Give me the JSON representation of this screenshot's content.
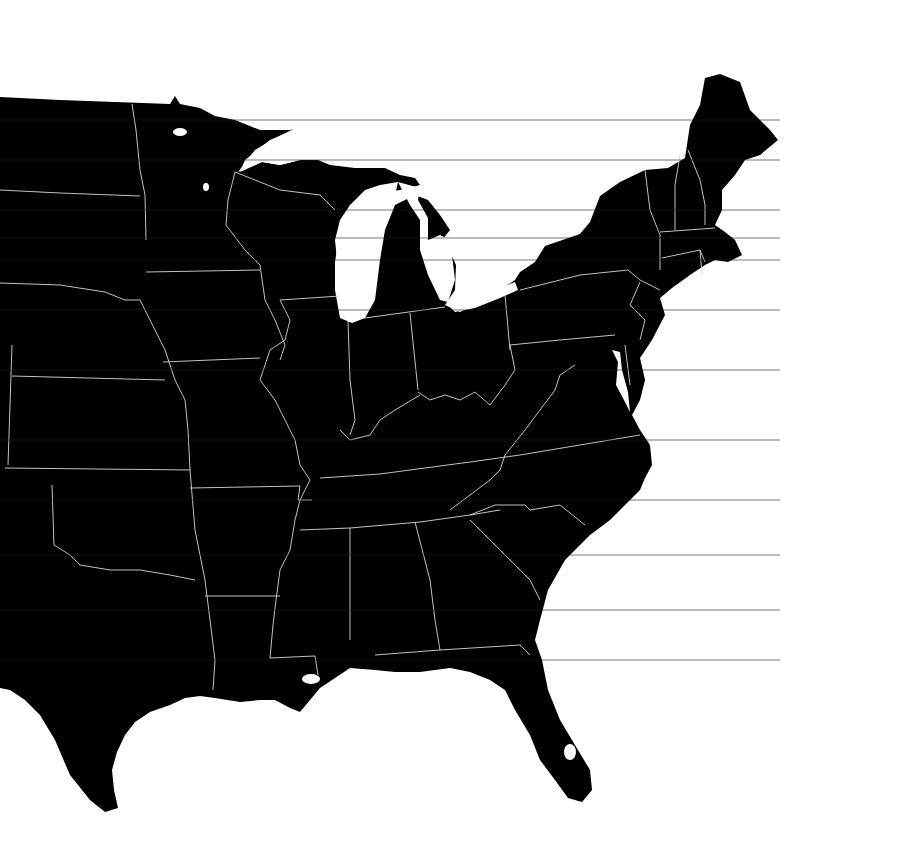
{
  "map": {
    "type": "choropleth-outline",
    "region": "Eastern United States",
    "colors": {
      "land": "#000000",
      "water": "#ffffff",
      "state_border": "#d8d8d8"
    },
    "labels": []
  }
}
